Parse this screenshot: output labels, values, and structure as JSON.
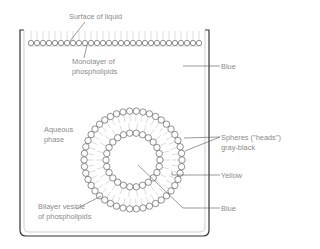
{
  "diagram": {
    "labels": {
      "surface": "Surface of liquid",
      "monolayer_line1": "Monolayer of",
      "monolayer_line2": "phospholipids",
      "blue_top": "Blue",
      "aqueous_line1": "Aqueous",
      "aqueous_line2": "phase",
      "spheres_line1": "Spheres (\"heads\")",
      "spheres_line2": "gray-black",
      "yellow": "Yellow",
      "bilayer_line1": "Bilayer vesicle",
      "bilayer_line2": "of phospholipids",
      "blue_bottom": "Blue"
    },
    "geometry": {
      "beaker": {
        "left": 22,
        "right": 207,
        "top": 30,
        "bottom": 236
      },
      "monolayer": {
        "y": 43,
        "x_start": 28,
        "x_end": 202,
        "head_radius": 3,
        "tail_top": 31
      },
      "vesicle": {
        "cx": 133,
        "cy": 160,
        "outer_radius": 49,
        "inner_radius": 27,
        "head_radius": 3.2,
        "outer_count": 46,
        "inner_count": 26
      }
    },
    "colors": {
      "line": "#333333",
      "leader": "#555555",
      "head_stroke": "#444444",
      "tail": "#bbbbbb",
      "text": "#8a8a8a"
    }
  }
}
